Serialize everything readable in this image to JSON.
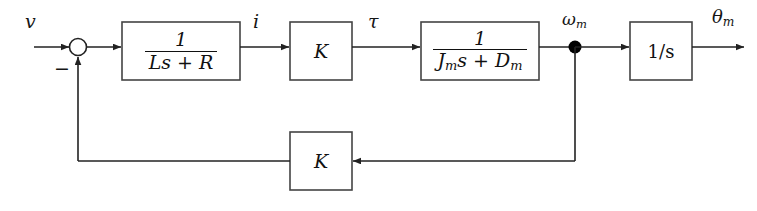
{
  "diagram": {
    "type": "control-block-diagram",
    "canvas": {
      "width": 757,
      "height": 211
    },
    "colors": {
      "line": "#222222",
      "block_border": "#444444",
      "background": "#ffffff",
      "text": "#151515",
      "node_fill": "#000000"
    },
    "signals": {
      "input": "v",
      "current": "i",
      "torque": "τ",
      "speed_base": "ω",
      "speed_sub": "m",
      "position_base": "θ",
      "position_sub": "m",
      "feedback_sign": "−"
    },
    "blocks": [
      {
        "id": "electrical-plant",
        "name": "1/(Ls + R)",
        "kind": "fraction",
        "numerator": "1",
        "denominator": "Ls + R",
        "denominator_parts": {
          "L": "L",
          "s": "s",
          "plus": "+",
          "R": "R"
        }
      },
      {
        "id": "torque-constant",
        "name": "K",
        "kind": "plain",
        "text": "K"
      },
      {
        "id": "mechanical-plant",
        "name": "1/(Jm s + Dm)",
        "kind": "fraction",
        "numerator": "1",
        "denominator": "Jms + Dm",
        "denominator_parts": {
          "J": "J",
          "J_sub": "m",
          "s": "s",
          "plus": "+",
          "D": "D",
          "D_sub": "m"
        }
      },
      {
        "id": "integrator",
        "name": "1/s",
        "kind": "plain",
        "text": "1/s"
      },
      {
        "id": "back-emf-constant",
        "name": "K",
        "kind": "plain",
        "text": "K"
      }
    ],
    "junctions": [
      {
        "id": "summing-junction",
        "style": "open-circle",
        "sign": "−"
      },
      {
        "id": "speed-takeoff-node",
        "style": "filled-dot"
      }
    ]
  }
}
